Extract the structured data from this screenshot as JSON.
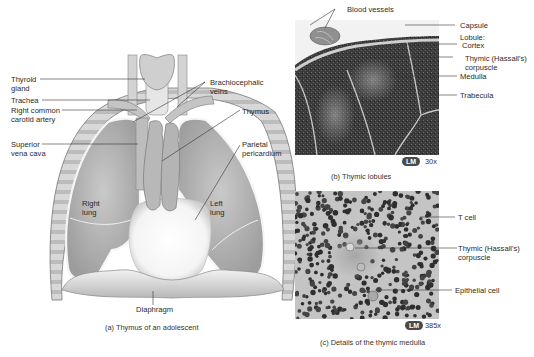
{
  "panel_a": {
    "caption": "(a) Thymus of an adolescent",
    "labels": {
      "thyroid_gland": "Thyroid\ngland",
      "trachea": "Trachea",
      "right_common_carotid": "Right common\ncarotid artery",
      "superior_vena_cava": "Superior\nvena cava",
      "brachiocephalic_veins": "Brachiocephalic\nveins",
      "thymus": "Thymus",
      "parietal_pericardium": "Parietal\npericardium",
      "right_lung": "Right\nlung",
      "left_lung": "Left\nlung",
      "diaphragm": "Diaphragm"
    }
  },
  "panel_b": {
    "caption": "(b) Thymic lobules",
    "badge": "LM",
    "magnification": "30x",
    "labels": {
      "blood_vessels": "Blood vessels",
      "capsule": "Capsule",
      "lobule": "Lobule:",
      "cortex": "Cortex",
      "thymic_corpuscle": "Thymic (Hassall's)\ncorpuscle",
      "medulla": "Medulla",
      "trabecula": "Trabecula"
    }
  },
  "panel_c": {
    "caption": "(c) Details of the thymic medulla",
    "badge": "LM",
    "magnification": "385x",
    "labels": {
      "t_cell": "T cell",
      "thymic_corpuscle": "Thymic (Hassall's)\ncorpuscle",
      "epithelial_cell": "Epithelial cell"
    }
  }
}
